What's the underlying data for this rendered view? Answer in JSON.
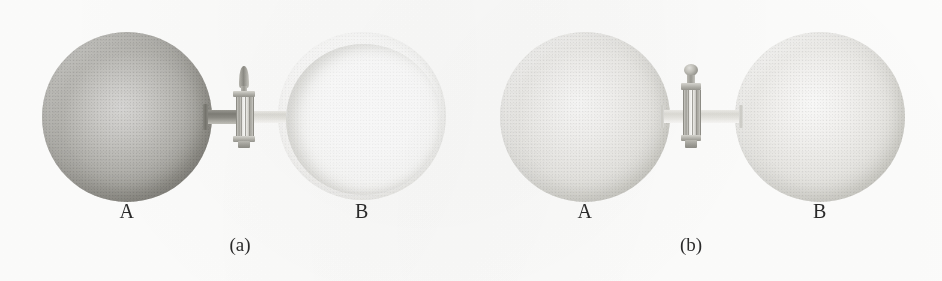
{
  "figure": {
    "type": "scientific-illustration",
    "background_color": "#fdfdfc",
    "width": 942,
    "height": 281
  },
  "panels": [
    {
      "id": "a",
      "caption": "(a)",
      "state_description": "stopcock closed",
      "vessels": [
        {
          "label": "A",
          "fill_state": "gas",
          "shade": "dark",
          "color": "#a3a29c"
        },
        {
          "label": "B",
          "fill_state": "vacuum",
          "shade": "empty",
          "color": "#fbfbfa"
        }
      ],
      "valve": {
        "name": "stopcock",
        "handle_shape": "pointed-finial",
        "position": "closed"
      },
      "tube": {
        "left_segment_shade": "dark",
        "right_segment_shade": "pale"
      }
    },
    {
      "id": "b",
      "caption": "(b)",
      "state_description": "stopcock open, gas equilibrated",
      "vessels": [
        {
          "label": "A",
          "fill_state": "gas",
          "shade": "light",
          "color": "#e6e5e1"
        },
        {
          "label": "B",
          "fill_state": "gas",
          "shade": "light",
          "color": "#e6e5e1"
        }
      ],
      "valve": {
        "name": "stopcock",
        "handle_shape": "round-knob",
        "position": "open"
      },
      "tube": {
        "left_segment_shade": "pale",
        "right_segment_shade": "pale"
      }
    }
  ]
}
